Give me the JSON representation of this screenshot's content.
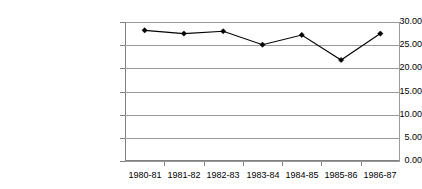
{
  "chart_data": {
    "type": "line",
    "title": "",
    "subtitle": "",
    "xlabel": "",
    "ylabel": "",
    "categories": [
      "1980-81",
      "1981-82",
      "1982-83",
      "1983-84",
      "1984-85",
      "1985-86",
      "1986-87"
    ],
    "values": [
      28.2,
      27.5,
      28.0,
      25.1,
      27.2,
      21.8,
      27.5
    ],
    "series": [
      {
        "name": "",
        "values": [
          28.2,
          27.5,
          28.0,
          25.1,
          27.2,
          21.8,
          27.5
        ]
      }
    ],
    "ylim": [
      0,
      30
    ],
    "ytick_labels": [
      "0.00",
      "5.00",
      "10.00",
      "15.00",
      "20.00",
      "25.00",
      "30.00"
    ],
    "ytick_values": [
      0,
      5,
      10,
      15,
      20,
      25,
      30
    ],
    "ytick_step": 5,
    "grid": true,
    "grid_axis": "y",
    "legend": false,
    "legend_position": "none",
    "marker": "diamond",
    "annotations": []
  },
  "style": {
    "background_color": "#ffffff",
    "gridline_color": "#9a9a9a",
    "axis_color": "#808080",
    "series_color": "#000000",
    "text_color": "#000000"
  }
}
